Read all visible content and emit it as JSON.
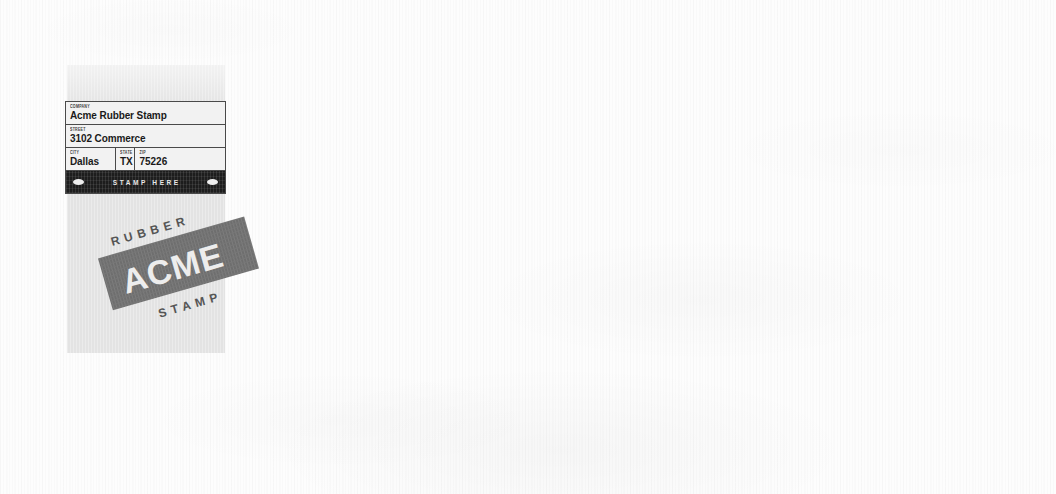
{
  "document": {
    "type": "scanned-mailing-label",
    "background_color": "#fdfdfd",
    "panel_color": "#e3e3e3"
  },
  "address_form": {
    "rows": [
      {
        "cells": [
          {
            "label": "COMPANY",
            "value": "Acme Rubber Stamp",
            "name": "company"
          }
        ]
      },
      {
        "cells": [
          {
            "label": "STREET",
            "value": "3102 Commerce",
            "name": "street"
          }
        ]
      },
      {
        "cells": [
          {
            "label": "CITY",
            "value": "Dallas",
            "name": "city"
          },
          {
            "label": "STATE",
            "value": "TX",
            "name": "state"
          },
          {
            "label": "ZIP",
            "value": "75226",
            "name": "zip"
          }
        ]
      }
    ]
  },
  "stamp_bar": {
    "label": "STAMP HERE",
    "background_color": "#1d1d1d",
    "text_color": "#e8e8e8",
    "ornament": "oval"
  },
  "logo": {
    "top_word": "RUBBER",
    "main_word": "ACME",
    "bottom_word": "STAMP",
    "badge_color": "#6e6e6e",
    "main_word_color": "#ededed",
    "outer_word_color": "#555555",
    "rotation_degrees": -16
  }
}
